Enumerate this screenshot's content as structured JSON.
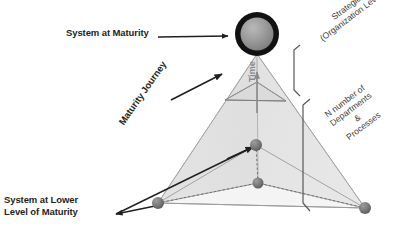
{
  "figure": {
    "background_color": "#ffffff",
    "text_color": "#231f20",
    "accent_gray": "#8a8a8a",
    "pyramid_fill": "#e3e3e3",
    "node_color": "#6f6f6f"
  },
  "labels": {
    "system_at_maturity": "System at Maturity",
    "system_at_lower_line1": "System at Lower",
    "system_at_lower_line2": "Level of Maturity",
    "maturity_journey": "Maturity Journey",
    "time": "Time",
    "strategic_line1": "Strategic",
    "strategic_line2": "(Organization Level)",
    "n_departments_line1": "N number of",
    "n_departments_line2": "Departments",
    "n_departments_line3": "&",
    "n_departments_line4": "Processes"
  },
  "nodes": {
    "apex": {
      "name": "system-at-maturity-sphere",
      "x": 257,
      "y": 34,
      "r": 22
    },
    "base_left": {
      "name": "base-left-node",
      "x": 158,
      "y": 203,
      "r": 6
    },
    "base_right": {
      "name": "base-right-node",
      "x": 365,
      "y": 208,
      "r": 6
    },
    "interior_upper": {
      "name": "interior-upper-node",
      "x": 256,
      "y": 145,
      "r": 6
    },
    "interior_lower": {
      "name": "interior-lower-node",
      "x": 258,
      "y": 183,
      "r": 6
    }
  },
  "brackets": {
    "strategic_bracket": {
      "top": 44,
      "bottom": 96
    },
    "departments_bracket": {
      "top": 98,
      "bottom": 211
    }
  }
}
